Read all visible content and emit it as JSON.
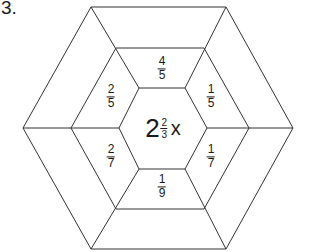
{
  "problem_number": "3.",
  "center": {
    "whole": "2",
    "numerator": "2",
    "denominator": "3",
    "variable": "x"
  },
  "segments": [
    {
      "position": "top",
      "numerator": "4",
      "denominator": "5"
    },
    {
      "position": "upper-right",
      "numerator": "1",
      "denominator": "5"
    },
    {
      "position": "lower-right",
      "numerator": "1",
      "denominator": "7"
    },
    {
      "position": "bottom",
      "numerator": "1",
      "denominator": "9"
    },
    {
      "position": "lower-left",
      "numerator": "2",
      "denominator": "7"
    },
    {
      "position": "upper-left",
      "numerator": "2",
      "denominator": "5"
    }
  ],
  "colors": {
    "line": "#333333",
    "text": "#1a1a1a",
    "background": "#ffffff"
  }
}
